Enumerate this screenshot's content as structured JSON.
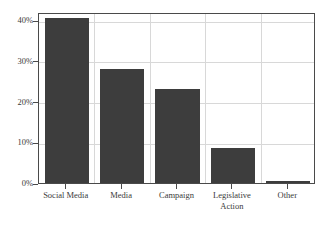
{
  "chart_data": {
    "type": "bar",
    "title": "",
    "subtitle": "",
    "xlabel": "",
    "ylabel": "",
    "categories": [
      "Social Media",
      "Media",
      "Campaign",
      "Legislative Action",
      "Other"
    ],
    "category_lines": [
      [
        "Social Media"
      ],
      [
        "Media"
      ],
      [
        "Campaign"
      ],
      [
        "Legislative",
        "Action"
      ],
      [
        "Other"
      ]
    ],
    "values": [
      40.5,
      28.0,
      23.0,
      8.5,
      0.4
    ],
    "value_labels": [
      "40.5%",
      "28.0%",
      "23.0%",
      "8.5%",
      "0.4%"
    ],
    "ylim": [
      0,
      42
    ],
    "yticks": [
      0,
      10,
      20,
      30,
      40
    ],
    "ytick_labels": [
      "0%",
      "10%",
      "20%",
      "30%",
      "40%"
    ],
    "grid": true,
    "grid_horizontal": true,
    "grid_vertical": true,
    "legend": false,
    "legend_position": "none",
    "bar_color": "#3d3d3d",
    "grid_color": "#d8d8d8",
    "axis_color": "#4a4a4a",
    "background_color": "#ffffff",
    "text_color": "#3a3a3a"
  }
}
